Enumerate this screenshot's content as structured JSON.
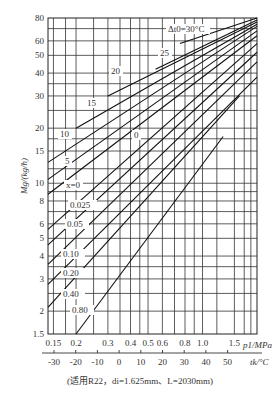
{
  "chart_data": {
    "type": "line",
    "title": "",
    "xlabel": "p1/MPa",
    "ylabel": "Mg/(kg/h)",
    "x_scale": "log",
    "y_scale": "log",
    "xlim": [
      0.14,
      2.0
    ],
    "ylim": [
      1.5,
      80
    ],
    "grid": true,
    "x_ticks": [
      "0.15",
      "0.2",
      "0.3",
      "0.4",
      "0.5",
      "0.6",
      "0.8",
      "1.0",
      "1.5"
    ],
    "y_ticks": [
      "1.5",
      "2",
      "3",
      "4",
      "5",
      "6",
      "8",
      "10",
      "15",
      "20",
      "30",
      "40",
      "50",
      "60",
      "80"
    ],
    "secondary_x_axis": {
      "label": "tk/°C",
      "ticks": [
        "-30",
        "-20",
        "-10",
        "0",
        "10",
        "20",
        "30",
        "40",
        "50"
      ]
    },
    "footnote": "(适用R22，di=1.625mm、L=2030mm)",
    "series_group_1": {
      "parameter": "Δt0 (subcooling, °C)",
      "series": [
        {
          "name": "Δt0=30°C",
          "label_text": "Δt0=30°C",
          "points": [
            [
              0.75,
              58
            ],
            [
              2.0,
              80
            ]
          ]
        },
        {
          "name": "25",
          "label_text": "25",
          "points": [
            [
              0.55,
              42
            ],
            [
              2.0,
              78
            ]
          ]
        },
        {
          "name": "20",
          "label_text": "20",
          "points": [
            [
              0.3,
              30
            ],
            [
              2.0,
              76
            ]
          ]
        },
        {
          "name": "15",
          "label_text": "15",
          "points": [
            [
              0.2,
              20
            ],
            [
              2.0,
              74
            ]
          ]
        },
        {
          "name": "10",
          "label_text": "10",
          "points": [
            [
              0.14,
              13
            ],
            [
              2.0,
              72
            ]
          ]
        },
        {
          "name": "5",
          "label_text": "5",
          "points": [
            [
              0.14,
              10.5
            ],
            [
              2.0,
              68
            ]
          ]
        },
        {
          "name": "0",
          "label_text": "0",
          "points": [
            [
              0.14,
              8.7
            ],
            [
              2.0,
              64
            ]
          ]
        }
      ]
    },
    "series_group_2": {
      "parameter": "x (inlet quality)",
      "series": [
        {
          "name": "x=0",
          "label_text": "x=0",
          "points": [
            [
              0.14,
              8.7
            ],
            [
              2.0,
              64
            ]
          ]
        },
        {
          "name": "0.025",
          "label_text": "0.025",
          "points": [
            [
              0.14,
              5.6
            ],
            [
              2.0,
              58
            ]
          ]
        },
        {
          "name": "0.05",
          "label_text": "0.05",
          "points": [
            [
              0.14,
              4.6
            ],
            [
              2.0,
              52
            ]
          ]
        },
        {
          "name": "0.10",
          "label_text": "0.10",
          "points": [
            [
              0.14,
              3.6
            ],
            [
              2.0,
              46
            ]
          ]
        },
        {
          "name": "0.20",
          "label_text": "0.20",
          "points": [
            [
              0.14,
              2.8
            ],
            [
              2.0,
              38
            ]
          ]
        },
        {
          "name": "0.40",
          "label_text": "0.40",
          "points": [
            [
              0.14,
              2.1
            ],
            [
              1.6,
              30
            ]
          ]
        },
        {
          "name": "0.80",
          "label_text": "0.80",
          "points": [
            [
              0.2,
              1.5
            ],
            [
              1.3,
              18
            ]
          ]
        }
      ]
    }
  },
  "labels": {
    "ylabel": "Mg/(kg/h)",
    "xlabel": "p1/MPa",
    "tlabel": "tk/°C",
    "footnote": "(适用R22，di=1.625mm、L=2030mm)",
    "dt_header": "Δt0=30°C"
  }
}
